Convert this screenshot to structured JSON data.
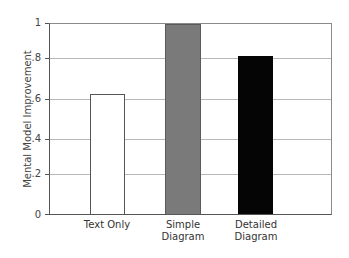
{
  "chart_data": {
    "type": "bar",
    "title": "",
    "xlabel": "",
    "ylabel": "Mental Model Improvement",
    "categories": [
      "Text Only",
      "Simple\nDiagram",
      "Detailed\nDiagram"
    ],
    "values": [
      0.63,
      1.0,
      0.83
    ],
    "bar_colors": [
      "#ffffff",
      "#7a7a7a",
      "#050505"
    ],
    "ylim": [
      0,
      1
    ],
    "yticks": [
      0,
      0.2,
      0.4,
      0.6,
      0.8,
      1
    ],
    "ytick_labels": [
      "0",
      ".2",
      ".4",
      ".6",
      ".8",
      "1"
    ],
    "grid": true,
    "legend": null
  },
  "axis": {
    "ylabel": "Mental Model Improvement",
    "yticks": [
      "0",
      ".2",
      ".4",
      ".6",
      ".8",
      "1"
    ]
  },
  "bars": [
    {
      "label": "Text Only",
      "value": 0.63
    },
    {
      "label": "Simple\nDiagram",
      "value": 1.0
    },
    {
      "label": "Detailed\nDiagram",
      "value": 0.83
    }
  ]
}
